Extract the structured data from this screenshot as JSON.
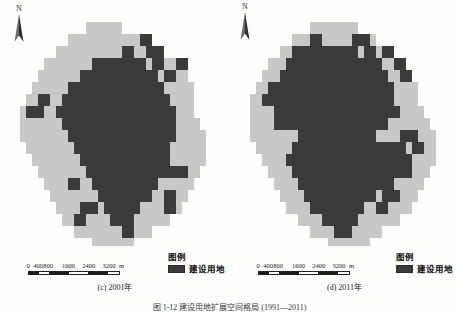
{
  "figure": {
    "caption": "图 1-12  建设用地扩展空间格局 (1991—2011)",
    "background": "#fdfdfb",
    "colors": {
      "builtup": "#3a3a3a",
      "other_land": "#c8c8c8",
      "text": "#1b1b1b"
    }
  },
  "panels": [
    {
      "id": "c",
      "caption": "(c) 2001年",
      "north_arrow": {
        "label": "N",
        "icon": "north-arrow-icon"
      },
      "scalebar": {
        "ticks": [
          "0",
          "400",
          "800",
          "1600",
          "2400",
          "3200"
        ],
        "unit": "m",
        "tick_positions_pct": [
          0,
          11,
          22,
          44,
          66,
          88
        ],
        "segments": [
          {
            "from_pct": 0,
            "to_pct": 11,
            "color": "#1b1b1b"
          },
          {
            "from_pct": 11,
            "to_pct": 22,
            "color": "#ffffff"
          },
          {
            "from_pct": 22,
            "to_pct": 44,
            "color": "#1b1b1b"
          },
          {
            "from_pct": 44,
            "to_pct": 66,
            "color": "#ffffff"
          },
          {
            "from_pct": 66,
            "to_pct": 88,
            "color": "#1b1b1b"
          },
          {
            "from_pct": 88,
            "to_pct": 100,
            "color": "#ffffff"
          }
        ]
      },
      "legend": {
        "title": "图例",
        "items": [
          {
            "label": "建设用地",
            "color": "#3a3a3a"
          }
        ]
      }
    },
    {
      "id": "d",
      "caption": "(d) 2011年",
      "north_arrow": {
        "label": "N",
        "icon": "north-arrow-icon"
      },
      "scalebar": {
        "ticks": [
          "0",
          "400",
          "800",
          "1600",
          "2400",
          "3200"
        ],
        "unit": "m",
        "tick_positions_pct": [
          0,
          11,
          22,
          44,
          66,
          88
        ],
        "segments": [
          {
            "from_pct": 0,
            "to_pct": 11,
            "color": "#1b1b1b"
          },
          {
            "from_pct": 11,
            "to_pct": 22,
            "color": "#ffffff"
          },
          {
            "from_pct": 22,
            "to_pct": 44,
            "color": "#1b1b1b"
          },
          {
            "from_pct": 44,
            "to_pct": 66,
            "color": "#ffffff"
          },
          {
            "from_pct": 66,
            "to_pct": 88,
            "color": "#1b1b1b"
          },
          {
            "from_pct": 88,
            "to_pct": 100,
            "color": "#ffffff"
          }
        ]
      },
      "legend": {
        "title": "图例",
        "items": [
          {
            "label": "建设用地",
            "color": "#3a3a3a"
          }
        ]
      }
    }
  ],
  "map_grids": {
    "cell": 6,
    "cols": 30,
    "rows": 38,
    "c2001": {
      "light": "..........................................................................................................#####.............................................................................#########..........................................................................###########.........................................................###############.......................................##################......................................####################...................................#######################.............................#########################..........................###########################.......................###########################.......................############################.....................##############################...................###############################..................###############################.................################################................################################...............################################...............###############################................##############################.................##############################.................#############################..................############################..................###########################....................##########################.....................########################.......................#####################.........................#################.............................############..................................#######......................................###.........................................",
      "dark": "..............................................................................................................................................................................................................................................##...................................#####.......##..............................########.....####...........................##########...####.........................############..####........................##############.####.......................#################...........#.........####################.......................#####################......................######################.....................#######################....................########################...................#######################....................######################.....................######################.....................#####################.......................####################........................###################.........................##################..........................#################...........................###############.............................############..............................#########..............................######................................###...................................."
    },
    "d2011": {
      "light": "..........................................................................................................######............................................................................###########.......................................................................#############.........................................................###############.......................................##################......................................####################...................................#######################.............................##########################.........................###########################.......................#############################....................##############################...................###############################..................################################.................################################................#################################..............#################################..............################################...............###############################................##############################.................#############################..................############################..................###########################....................##########################.....................########################.......................#####################.........................##################............................############..................................#######......................................###.........................................",
      "dark": ".............................................................................................................................................................................................###..##.....................................#######...#####.............................##########..######...........................#############..#####.........................###############.#####........................###################.###.......................####################..##......................#####################...#.....................########################.......................#########################......................##########################.....................###########################....................###########################...................###########################...................##########################....................#########################.....................########################......................#######################.......................######################........................####################..........................##################...........................###############.............................############..............................########..............................####................................"
    }
  }
}
